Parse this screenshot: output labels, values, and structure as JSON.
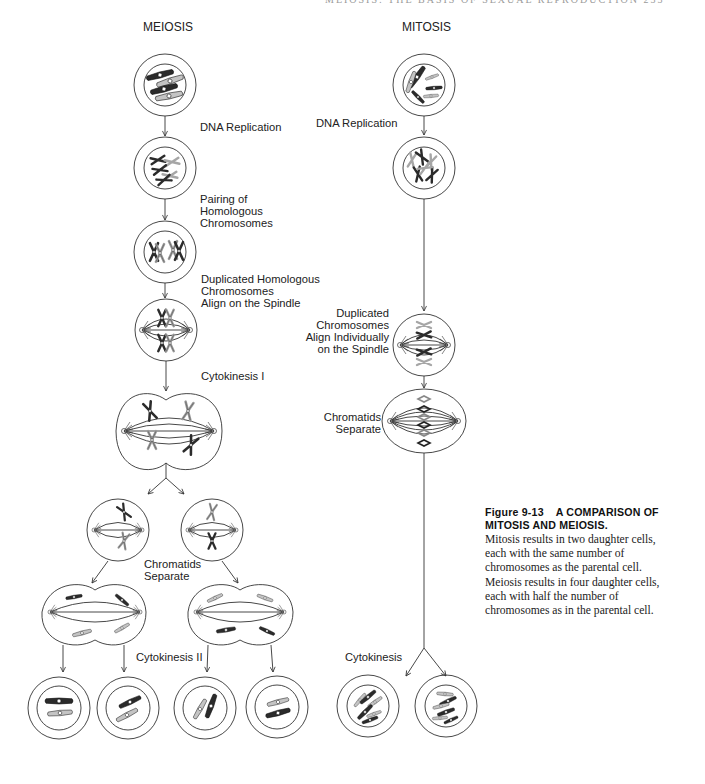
{
  "page": {
    "running_head": "MEIOSIS: THE BASIS OF SEXUAL REPRODUCTION          233"
  },
  "meiosis": {
    "title": "MEIOSIS",
    "steps": {
      "dna_replication": "DNA Replication",
      "pairing_line1": "Pairing of",
      "pairing_line2": "Homologous",
      "pairing_line3": "Chromosomes",
      "align_line1": "Duplicated Homologous",
      "align_line2": "Chromosomes",
      "align_line3": "Align on the Spindle",
      "cytokinesis_1": "Cytokinesis  I",
      "chromatids_line1": "Chromatids",
      "chromatids_line2": "Separate",
      "cytokinesis_2": "Cytokinesis  II"
    },
    "daughter_cells": 4
  },
  "mitosis": {
    "title": "MITOSIS",
    "steps": {
      "dna_replication": "DNA Replication",
      "align_line1": "Duplicated",
      "align_line2": "Chromosomes",
      "align_line3": "Align Individually",
      "align_line4": "on the Spindle",
      "chromatids_line1": "Chromatids",
      "chromatids_line2": "Separate",
      "cytokinesis": "Cytokinesis"
    },
    "daughter_cells": 2
  },
  "caption": {
    "figure_number": "Figure 9-13",
    "title_line1": "A COMPARISON OF",
    "title_line2": "MITOSIS AND MEIOSIS.",
    "body_lines": [
      "Mitosis results in two daughter cells,",
      "each with the same number of",
      "chromosomes as the parental cell.",
      "Meiosis results in four daughter cells,",
      "each with half the number of",
      "chromosomes as in the parental cell."
    ]
  },
  "colors": {
    "line": "#333333",
    "dark_chromosome": "#2b2b2b",
    "light_chromosome": "#b8b8b8",
    "text": "#222222"
  }
}
